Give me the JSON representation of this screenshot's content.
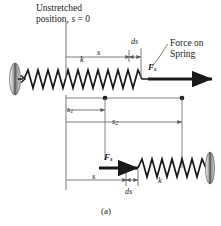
{
  "figure": {
    "caption": "(a)",
    "annotations": {
      "unstretched_line1": "Unstretched",
      "unstretched_line2_prefix": "position, ",
      "unstretched_line2_var": "s",
      "unstretched_line2_eq": " = 0",
      "force_line1": "Force on",
      "force_line2": "Spring",
      "ds_upper": "ds",
      "ds_lower": "ds",
      "s_upper": "s",
      "s_lower": "s",
      "s1": "s",
      "s1_sub": "1",
      "s2": "s",
      "s2_sub": "2",
      "k_upper": "k",
      "k_lower": "k",
      "force_symbol": "F",
      "force_subscript": "s"
    },
    "colors": {
      "stroke": "#1a1a1a",
      "dimension_line": "#6e6e6e",
      "wall_fill": "#9a9a9a",
      "background": "#ffffff"
    }
  }
}
